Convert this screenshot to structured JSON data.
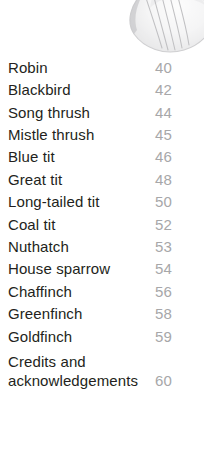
{
  "page": {
    "background_color": "#ffffff",
    "label_color": "#231f20",
    "page_number_color": "#a7a7a9"
  },
  "illustration": {
    "name": "bird-wing-illustration",
    "description": "faded grayscale bird wing and tail feather illustration",
    "tone_color": "#c9c9cb"
  },
  "contents": {
    "entries": [
      {
        "label": "Robin",
        "page": "40"
      },
      {
        "label": "Blackbird",
        "page": "42"
      },
      {
        "label": "Song thrush",
        "page": "44"
      },
      {
        "label": "Mistle thrush",
        "page": "45"
      },
      {
        "label": "Blue tit",
        "page": "46"
      },
      {
        "label": "Great tit",
        "page": "48"
      },
      {
        "label": "Long-tailed tit",
        "page": "50"
      },
      {
        "label": "Coal tit",
        "page": "52"
      },
      {
        "label": "Nuthatch",
        "page": "53"
      },
      {
        "label": "House sparrow",
        "page": "54"
      },
      {
        "label": "Chaffinch",
        "page": "56"
      },
      {
        "label": "Greenfinch",
        "page": "58"
      },
      {
        "label": "Goldfinch",
        "page": "59"
      },
      {
        "label": "Credits and\nacknowledgements",
        "page": "60"
      }
    ]
  }
}
